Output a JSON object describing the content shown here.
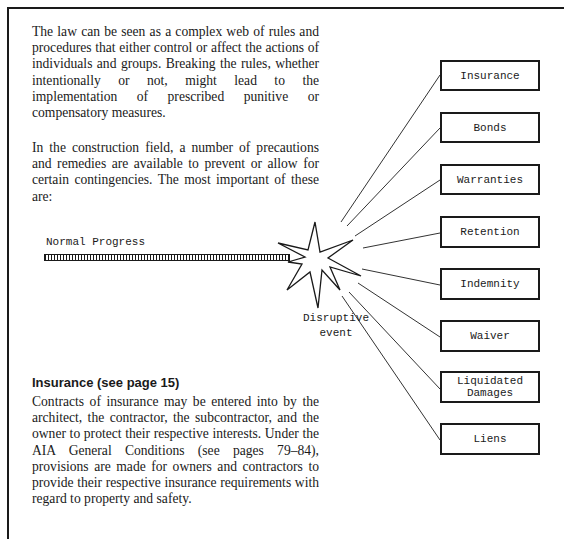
{
  "intro": {
    "paragraph_1": "The law can be seen as a complex web of rules and procedures that either control or affect the actions of individuals and groups. Breaking the rules, whether intentionally or not, might lead to the implementation of prescribed punitive or compensatory measures.",
    "paragraph_2": "In the construction field, a number of precautions and remedies are available to prevent or allow for certain contingencies. The most important of these are:"
  },
  "diagram": {
    "progress_label": "Normal Progress",
    "event_label_line1": "Disruptive",
    "event_label_line2": "event",
    "remedies": [
      {
        "label": "Insurance"
      },
      {
        "label": "Bonds"
      },
      {
        "label": "Warranties"
      },
      {
        "label": "Retention"
      },
      {
        "label": "Indemnity"
      },
      {
        "label": "Waiver"
      },
      {
        "label": "Liquidated\nDamages"
      },
      {
        "label": "Liens"
      }
    ]
  },
  "section": {
    "heading": "Insurance (see page 15)",
    "body": "Contracts of insurance may be entered into by the architect, the contractor, the subcontractor, and the owner to protect their respective interests. Under the AIA General Conditions (see pages 79–84), provisions are made for owners and contractors to provide their respective insurance requirements with regard to property and safety."
  }
}
